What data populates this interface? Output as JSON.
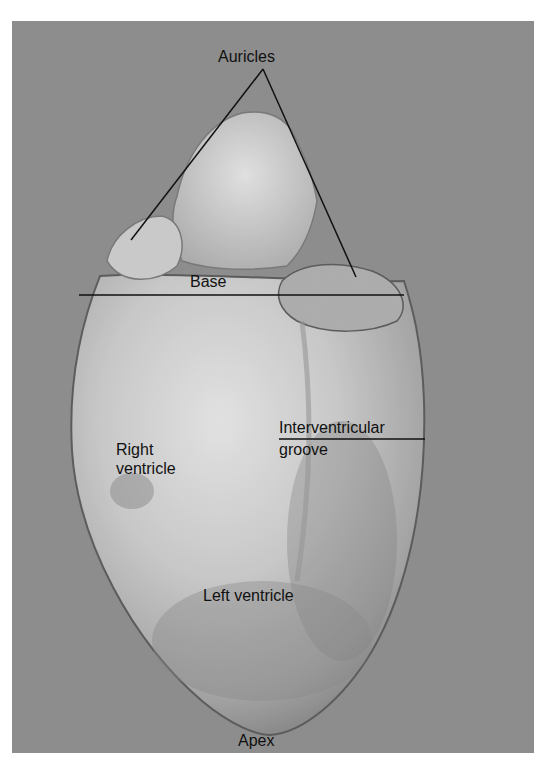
{
  "figure": {
    "labels": {
      "auricles": "Auricles",
      "base": "Base",
      "right_ventricle_line1": "Right",
      "right_ventricle_line2": "ventricle",
      "interventricular_line1": "Interventricular",
      "interventricular_line2": "groove",
      "left_ventricle": "Left ventricle",
      "apex": "Apex"
    },
    "colors": {
      "background": "#8e8e8e",
      "heart_light": "#e8e8e8",
      "heart_mid": "#bdbdbd",
      "heart_dark": "#6e6e6e",
      "label": "#111111"
    }
  }
}
